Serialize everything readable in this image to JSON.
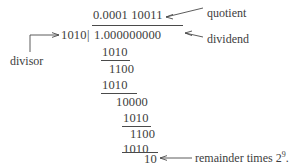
{
  "figure": {
    "type": "binary-long-division",
    "quotient": "0.0001 10011",
    "divisor": "1010",
    "dividend": "1.000000000",
    "separator": "|",
    "steps": [
      {
        "value": "1010",
        "underline": true
      },
      {
        "value": "1100",
        "underline": false
      },
      {
        "value": "1010",
        "underline": true
      },
      {
        "value": "10000",
        "underline": false
      },
      {
        "value": "1010",
        "underline": true
      },
      {
        "value": "1100",
        "underline": false
      },
      {
        "value": "1010",
        "underline": true
      },
      {
        "value": "10",
        "underline": false
      }
    ],
    "labels": {
      "quotient": "quotient",
      "dividend": "dividend",
      "divisor": "divisor",
      "remainder_prefix": "remainder times 2",
      "remainder_exponent": "9",
      "remainder_suffix": "."
    },
    "colors": {
      "ink": "#3d3d3d",
      "rule": "#4a4a4a",
      "background": "#ffffff"
    }
  }
}
